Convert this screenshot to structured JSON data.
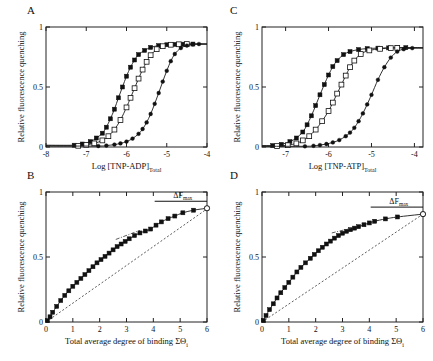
{
  "figure": {
    "width": 433,
    "height": 361,
    "background": "#ffffff",
    "ink": "#111111"
  },
  "panels": [
    {
      "id": "A",
      "label": "A"
    },
    {
      "id": "C",
      "label": "C"
    },
    {
      "id": "B",
      "label": "B"
    },
    {
      "id": "D",
      "label": "D"
    }
  ],
  "labels": {
    "y_axis": "Relative fluorescence quenching",
    "x_axis_A": "Log [TNP-ADP]",
    "x_axis_A_sub": "Total",
    "x_axis_C": "Log [TNP-ATP]",
    "x_axis_C_sub": "Total",
    "x_axis_BD": "Total average degree of binding ΣΘ",
    "x_axis_BD_sub": "i",
    "delta_f_max": "ΔF",
    "delta_f_max_sub": "max"
  },
  "chart_data": [
    {
      "id": "A",
      "type": "scatter",
      "title": "A",
      "xlabel": "Log [TNP-ADP]Total",
      "ylabel": "Relative fluorescence quenching",
      "xlim": [
        -8,
        -4
      ],
      "ylim": [
        0,
        1
      ],
      "xticks": [
        -8,
        -7,
        -6,
        -5,
        -4
      ],
      "xticklabels": [
        "-8",
        "-7",
        "-6",
        "-5",
        "-4"
      ],
      "yticks": [
        0,
        0.5,
        1
      ],
      "yticklabels": [
        "0",
        "0.5",
        "1"
      ],
      "grid": false,
      "legend": "none",
      "series": [
        {
          "name": "filled-squares",
          "marker": "filled-square",
          "x": [
            -7.3,
            -7.1,
            -6.9,
            -6.75,
            -6.6,
            -6.5,
            -6.4,
            -6.3,
            -6.2,
            -6.1,
            -6.0,
            -5.9,
            -5.8,
            -5.7,
            -5.55,
            -5.4,
            -5.2,
            -5.0,
            -4.8,
            -4.6,
            -4.35
          ],
          "y": [
            0.015,
            0.025,
            0.045,
            0.075,
            0.115,
            0.165,
            0.235,
            0.315,
            0.41,
            0.5,
            0.59,
            0.665,
            0.725,
            0.77,
            0.805,
            0.83,
            0.845,
            0.852,
            0.855,
            0.857,
            0.858
          ]
        },
        {
          "name": "open-squares",
          "marker": "open-square",
          "x": [
            -7.2,
            -7.0,
            -6.8,
            -6.6,
            -6.45,
            -6.3,
            -6.15,
            -6.0,
            -5.9,
            -5.8,
            -5.7,
            -5.6,
            -5.5,
            -5.4,
            -5.25,
            -5.1,
            -4.9,
            -4.7,
            -4.5
          ],
          "y": [
            0.01,
            0.018,
            0.03,
            0.055,
            0.09,
            0.145,
            0.225,
            0.33,
            0.41,
            0.49,
            0.57,
            0.645,
            0.71,
            0.765,
            0.815,
            0.84,
            0.852,
            0.856,
            0.858
          ]
        },
        {
          "name": "filled-circles",
          "marker": "filled-circle",
          "x": [
            -6.7,
            -6.5,
            -6.3,
            -6.15,
            -6.0,
            -5.85,
            -5.7,
            -5.6,
            -5.5,
            -5.4,
            -5.3,
            -5.2,
            -5.1,
            -5.0,
            -4.9,
            -4.8,
            -4.65,
            -4.5,
            -4.35,
            -4.2
          ],
          "y": [
            0.008,
            0.012,
            0.02,
            0.03,
            0.045,
            0.07,
            0.11,
            0.15,
            0.205,
            0.275,
            0.36,
            0.45,
            0.545,
            0.635,
            0.715,
            0.775,
            0.825,
            0.845,
            0.855,
            0.858
          ]
        }
      ]
    },
    {
      "id": "C",
      "type": "scatter",
      "title": "C",
      "xlabel": "Log [TNP-ATP]Total",
      "ylabel": "Relative fluorescence quenching",
      "xlim": [
        -7.55,
        -3.8
      ],
      "ylim": [
        0,
        1
      ],
      "xticks": [
        -7,
        -6,
        -5,
        -4
      ],
      "xticklabels": [
        "-7",
        "-6",
        "-5",
        "-4"
      ],
      "yticks": [
        0,
        0.5,
        1
      ],
      "yticklabels": [
        "0",
        "0.5",
        "1"
      ],
      "grid": false,
      "legend": "none",
      "series": [
        {
          "name": "filled-squares",
          "marker": "filled-square",
          "x": [
            -7.3,
            -7.1,
            -6.9,
            -6.75,
            -6.6,
            -6.5,
            -6.4,
            -6.3,
            -6.2,
            -6.1,
            -6.0,
            -5.9,
            -5.8,
            -5.65,
            -5.5,
            -5.3,
            -5.1,
            -4.85,
            -4.6,
            -4.4,
            -4.2
          ],
          "y": [
            0.012,
            0.022,
            0.045,
            0.075,
            0.125,
            0.185,
            0.26,
            0.345,
            0.435,
            0.52,
            0.6,
            0.67,
            0.72,
            0.77,
            0.795,
            0.812,
            0.82,
            0.824,
            0.826,
            0.827,
            0.828
          ]
        },
        {
          "name": "open-squares",
          "marker": "open-square",
          "x": [
            -7.2,
            -6.95,
            -6.75,
            -6.6,
            -6.45,
            -6.3,
            -6.15,
            -6.0,
            -5.9,
            -5.8,
            -5.7,
            -5.6,
            -5.5,
            -5.4,
            -5.25,
            -5.05,
            -4.8,
            -4.55,
            -4.4
          ],
          "y": [
            0.008,
            0.015,
            0.03,
            0.055,
            0.09,
            0.145,
            0.215,
            0.3,
            0.37,
            0.445,
            0.52,
            0.595,
            0.665,
            0.72,
            0.775,
            0.805,
            0.818,
            0.824,
            0.826
          ]
        },
        {
          "name": "filled-circles",
          "marker": "filled-circle",
          "x": [
            -6.55,
            -6.35,
            -6.2,
            -6.05,
            -5.9,
            -5.75,
            -5.6,
            -5.5,
            -5.4,
            -5.3,
            -5.2,
            -5.1,
            -5.0,
            -4.85,
            -4.7,
            -4.55,
            -4.4,
            -4.25,
            -4.05
          ],
          "y": [
            0.006,
            0.01,
            0.016,
            0.025,
            0.038,
            0.058,
            0.09,
            0.12,
            0.16,
            0.215,
            0.28,
            0.355,
            0.435,
            0.56,
            0.665,
            0.745,
            0.795,
            0.815,
            0.824
          ]
        }
      ]
    },
    {
      "id": "B",
      "type": "scatter",
      "title": "B",
      "xlabel": "Total average degree of binding ΣΘi",
      "ylabel": "Relative fluorescence quenching",
      "xlim": [
        0,
        6
      ],
      "ylim": [
        0,
        1
      ],
      "xticks": [
        0,
        1,
        2,
        3,
        4,
        5,
        6
      ],
      "xticklabels": [
        "0",
        "1",
        "2",
        "3",
        "4",
        "5",
        "6"
      ],
      "yticks": [
        0,
        0.5,
        1
      ],
      "yticklabels": [
        "0",
        "0.5",
        "1"
      ],
      "grid": false,
      "legend": "none",
      "annotation": "ΔFmax",
      "reference_line": {
        "type": "dashed-diagonal",
        "from": [
          0,
          0
        ],
        "to": [
          6,
          0.87
        ]
      },
      "tangent_line": {
        "type": "dash-dot",
        "from": [
          2.6,
          0.635
        ],
        "to": [
          3.5,
          0.705
        ]
      },
      "series": [
        {
          "name": "filled-squares",
          "marker": "filled-square",
          "x": [
            0.05,
            0.15,
            0.25,
            0.4,
            0.55,
            0.7,
            0.85,
            1.0,
            1.15,
            1.3,
            1.45,
            1.6,
            1.75,
            1.9,
            2.05,
            2.2,
            2.35,
            2.5,
            2.65,
            2.8,
            2.95,
            3.1,
            3.3,
            3.5,
            3.7,
            3.9,
            4.1,
            4.3,
            4.55,
            4.8,
            5.1,
            5.5,
            6.0
          ],
          "y": [
            0.01,
            0.04,
            0.075,
            0.12,
            0.165,
            0.205,
            0.24,
            0.275,
            0.305,
            0.335,
            0.365,
            0.395,
            0.425,
            0.455,
            0.48,
            0.505,
            0.53,
            0.555,
            0.58,
            0.6,
            0.62,
            0.64,
            0.665,
            0.685,
            0.7,
            0.715,
            0.745,
            0.77,
            0.795,
            0.815,
            0.84,
            0.86,
            0.875
          ]
        }
      ]
    },
    {
      "id": "D",
      "type": "scatter",
      "title": "D",
      "xlabel": "Total average degree of binding ΣΘi",
      "ylabel": "Relative fluorescence quenching",
      "xlim": [
        0,
        6
      ],
      "ylim": [
        0,
        1
      ],
      "xticks": [
        0,
        1,
        2,
        3,
        4,
        5,
        6
      ],
      "xticklabels": [
        "0",
        "1",
        "2",
        "3",
        "4",
        "5",
        "6"
      ],
      "yticks": [
        0,
        0.5,
        1
      ],
      "yticklabels": [
        "0",
        "0.5",
        "1"
      ],
      "grid": false,
      "legend": "none",
      "annotation": "ΔFmax",
      "reference_line": {
        "type": "dashed-diagonal",
        "from": [
          0,
          0
        ],
        "to": [
          6,
          0.83
        ]
      },
      "tangent_line": {
        "type": "dash-dot",
        "from": [
          2.6,
          0.685
        ],
        "to": [
          3.4,
          0.725
        ]
      },
      "series": [
        {
          "name": "filled-squares",
          "marker": "filled-square",
          "x": [
            0.05,
            0.15,
            0.28,
            0.42,
            0.56,
            0.7,
            0.85,
            1.0,
            1.15,
            1.3,
            1.45,
            1.62,
            1.8,
            1.95,
            2.1,
            2.25,
            2.4,
            2.55,
            2.7,
            2.85,
            3.0,
            3.15,
            3.3,
            3.45,
            3.6,
            3.8,
            4.0,
            4.2,
            4.6,
            5.05,
            6.0
          ],
          "y": [
            0.012,
            0.05,
            0.095,
            0.14,
            0.185,
            0.225,
            0.265,
            0.305,
            0.345,
            0.385,
            0.42,
            0.455,
            0.49,
            0.52,
            0.548,
            0.575,
            0.6,
            0.622,
            0.645,
            0.665,
            0.683,
            0.698,
            0.71,
            0.722,
            0.733,
            0.748,
            0.762,
            0.775,
            0.793,
            0.808,
            0.83
          ]
        }
      ]
    }
  ]
}
